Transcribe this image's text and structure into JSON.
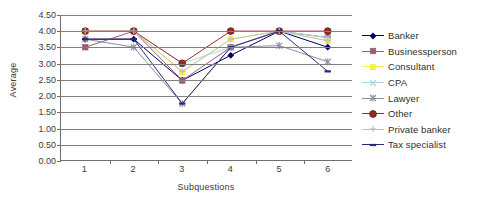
{
  "chart_data": {
    "type": "line",
    "title": "",
    "xlabel": "Subquestions",
    "ylabel": "Average",
    "categories": [
      "1",
      "2",
      "3",
      "4",
      "5",
      "6"
    ],
    "x": [
      1,
      2,
      3,
      4,
      5,
      6
    ],
    "ylim": [
      0.0,
      4.5
    ],
    "yticks": [
      "0.00",
      "0.50",
      "1.00",
      "1.50",
      "2.00",
      "2.50",
      "3.00",
      "3.50",
      "4.00",
      "4.50"
    ],
    "ytick_values": [
      0.0,
      0.5,
      1.0,
      1.5,
      2.0,
      2.5,
      3.0,
      3.5,
      4.0,
      4.5
    ],
    "grid": "horizontal",
    "legend_position": "right",
    "series": [
      {
        "name": "Banker",
        "color": "#000060",
        "marker": "diamond",
        "values": [
          3.75,
          3.75,
          2.47,
          3.25,
          4.0,
          3.5
        ]
      },
      {
        "name": "Businessperson",
        "color": "#9C5A78",
        "marker": "square",
        "values": [
          3.5,
          4.0,
          2.47,
          3.5,
          4.0,
          3.8
        ]
      },
      {
        "name": "Consultant",
        "color": "#F2F24A",
        "marker": "square",
        "values": [
          4.0,
          4.0,
          2.72,
          3.75,
          4.0,
          3.7
        ]
      },
      {
        "name": "CPA",
        "color": "#A8D8E8",
        "marker": "cross",
        "values": [
          4.0,
          4.0,
          3.0,
          3.5,
          4.0,
          3.8
        ]
      },
      {
        "name": "Lawyer",
        "color": "#8C8CA0",
        "marker": "star",
        "values": [
          3.75,
          3.5,
          1.75,
          3.5,
          3.55,
          3.05
        ]
      },
      {
        "name": "Other",
        "color": "#9E2B20",
        "marker": "circle",
        "values": [
          4.0,
          4.0,
          3.0,
          4.0,
          4.0,
          4.0
        ]
      },
      {
        "name": "Private banker",
        "color": "#BFBFBF",
        "marker": "plus",
        "values": [
          4.0,
          4.0,
          2.75,
          3.75,
          4.0,
          3.7
        ]
      },
      {
        "name": "Tax specialist",
        "color": "#282878",
        "marker": "dash",
        "values": [
          3.75,
          3.75,
          1.75,
          3.5,
          4.0,
          2.75
        ]
      }
    ]
  },
  "axes": {
    "y_title": "Average",
    "x_title": "Subquestions"
  },
  "colors": {
    "axis": "#6f6f6f",
    "gridline": "#808080",
    "text": "#3a3a3a",
    "background": "#ffffff"
  }
}
